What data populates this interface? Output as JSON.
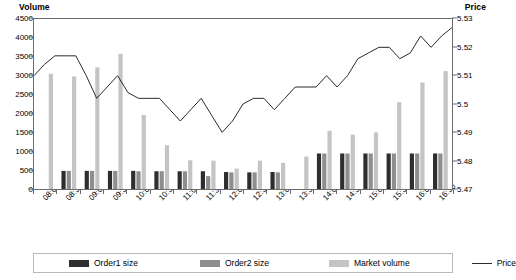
{
  "axes": {
    "left_title": "Volume",
    "right_title": "Price",
    "left_ticks": [
      "4500",
      "4000",
      "3500",
      "3000",
      "2500",
      "2000",
      "1500",
      "1000",
      "500",
      "0"
    ],
    "right_ticks": [
      "5.53",
      "5.52",
      "5.51",
      "5.5",
      "5.49",
      "5.48",
      "5.47"
    ]
  },
  "legend": {
    "order1": "Order1 size",
    "order2": "Order2 size",
    "market": "Market volume",
    "price": "Price"
  },
  "colors": {
    "order1": "#2e2e2e",
    "order2": "#8e8e8e",
    "market": "#c4c4c4",
    "price": "#2b2b2b",
    "axis": "#6b6b6b"
  },
  "chart_data": {
    "type": "bar",
    "title": "",
    "xlabel": "",
    "ylabel": "Volume",
    "y2label": "Price",
    "ylim": [
      0,
      4500
    ],
    "y2lim": [
      5.47,
      5.53
    ],
    "grid": false,
    "legend_position": "bottom",
    "categories": [
      "08:00",
      "08:30",
      "09:00",
      "09:30",
      "10:00",
      "10:30",
      "11:00",
      "11:30",
      "12:00",
      "12:30",
      "13:00",
      "13:30",
      "14:00",
      "14:30",
      "15:00",
      "15:30",
      "16:00",
      "16:30"
    ],
    "tick_labels": [
      "08:00",
      "08:30",
      "09:00",
      "09:30",
      "10:00",
      "10:30",
      "11:00",
      "11:30",
      "12:00",
      "12:30",
      "13:00",
      "13:30",
      "14:00",
      "14:30",
      "15:00",
      "15:30",
      "16:00",
      "16:30"
    ],
    "series": [
      {
        "name": "Order1 size",
        "type": "bar",
        "axis": "left",
        "color": "#2e2e2e",
        "values": [
          0,
          480,
          480,
          480,
          480,
          470,
          470,
          470,
          450,
          440,
          450,
          0,
          940,
          940,
          940,
          940,
          940,
          940
        ]
      },
      {
        "name": "Order2 size",
        "type": "bar",
        "axis": "left",
        "color": "#8e8e8e",
        "values": [
          0,
          480,
          480,
          480,
          470,
          470,
          470,
          340,
          440,
          440,
          440,
          0,
          940,
          940,
          940,
          940,
          940,
          940
        ]
      },
      {
        "name": "Market volume",
        "type": "bar",
        "axis": "left",
        "color": "#c4c4c4",
        "values": [
          3050,
          2980,
          3220,
          3580,
          1960,
          1160,
          760,
          750,
          540,
          750,
          690,
          860,
          1540,
          1440,
          1500,
          2300,
          2820,
          3120
        ]
      },
      {
        "name": "Price",
        "type": "line",
        "axis": "right",
        "color": "#2b2b2b",
        "values": [
          5.51,
          5.517,
          5.517,
          5.51,
          5.502,
          5.506,
          5.51,
          5.504,
          5.502,
          5.502,
          5.498,
          5.494,
          5.498,
          5.502,
          5.496,
          5.49,
          5.5,
          5.504
        ]
      }
    ],
    "price_points": [
      5.51,
      5.514,
      5.517,
      5.517,
      5.517,
      5.51,
      5.502,
      5.506,
      5.51,
      5.504,
      5.502,
      5.502,
      5.502,
      5.498,
      5.494,
      5.498,
      5.502,
      5.496,
      5.49,
      5.494,
      5.5,
      5.502,
      5.502,
      5.498,
      5.502,
      5.506,
      5.506,
      5.506,
      5.51,
      5.506,
      5.51,
      5.516,
      5.518,
      5.52,
      5.52,
      5.516,
      5.518,
      5.524,
      5.52,
      5.524,
      5.527
    ]
  }
}
